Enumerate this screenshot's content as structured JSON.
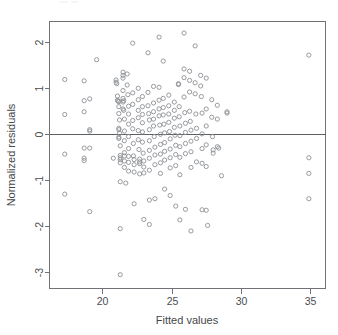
{
  "chart_data": {
    "type": "scatter",
    "title": "",
    "xlabel": "Fitted values",
    "ylabel": "Normalized residuals",
    "xlim": [
      16.2,
      36.1
    ],
    "ylim": [
      -3.35,
      2.45
    ],
    "grid": false,
    "legend": null,
    "marker": "open-circle",
    "marker_color": "#8d9094",
    "xticks": [
      20,
      25,
      30,
      35
    ],
    "xtick_labels": [
      "20",
      "25",
      "30",
      "35"
    ],
    "yticks": [
      2,
      1,
      0,
      -1,
      -2,
      -3
    ],
    "ytick_labels": [
      "2",
      "1",
      "0",
      "-1",
      "-2",
      "-3"
    ],
    "reference_lines": [
      {
        "orientation": "horizontal",
        "value": 0,
        "color": "#5d6063"
      }
    ],
    "n_points": 201,
    "points": [
      [
        17.3,
        1.19
      ],
      [
        17.3,
        0.43
      ],
      [
        17.3,
        -0.43
      ],
      [
        17.3,
        -1.3
      ],
      [
        18.7,
        1.16
      ],
      [
        18.7,
        0.73
      ],
      [
        18.7,
        0.49
      ],
      [
        18.7,
        -0.3
      ],
      [
        18.7,
        -0.52
      ],
      [
        18.7,
        -0.57
      ],
      [
        19.1,
        0.77
      ],
      [
        19.1,
        0.1
      ],
      [
        19.1,
        0.07
      ],
      [
        19.1,
        -0.3
      ],
      [
        19.1,
        -1.68
      ],
      [
        19.6,
        1.62
      ],
      [
        20.8,
        -0.52
      ],
      [
        21.0,
        1.18
      ],
      [
        21.0,
        1.13
      ],
      [
        21.05,
        1.1
      ],
      [
        21.1,
        0.83
      ],
      [
        21.1,
        0.74
      ],
      [
        21.15,
        0.72
      ],
      [
        21.2,
        0.71
      ],
      [
        21.2,
        0.6
      ],
      [
        21.2,
        0.45
      ],
      [
        21.25,
        0.31
      ],
      [
        21.2,
        0.13
      ],
      [
        21.2,
        0.1
      ],
      [
        21.25,
        0.02
      ],
      [
        21.2,
        -0.06
      ],
      [
        21.2,
        -0.09
      ],
      [
        21.3,
        -0.25
      ],
      [
        21.3,
        -0.46
      ],
      [
        21.3,
        -0.51
      ],
      [
        21.3,
        -0.55
      ],
      [
        21.3,
        -0.62
      ],
      [
        21.3,
        -1.03
      ],
      [
        21.3,
        -2.05
      ],
      [
        21.3,
        -3.05
      ],
      [
        21.5,
        1.35
      ],
      [
        21.5,
        1.28
      ],
      [
        21.5,
        1.22
      ],
      [
        21.5,
        0.95
      ],
      [
        21.5,
        0.78
      ],
      [
        21.55,
        0.73
      ],
      [
        21.5,
        0.7
      ],
      [
        21.5,
        0.55
      ],
      [
        21.55,
        0.52
      ],
      [
        21.6,
        0.33
      ],
      [
        21.6,
        0.07
      ],
      [
        21.6,
        -0.14
      ],
      [
        21.6,
        -0.4
      ],
      [
        21.6,
        -0.47
      ],
      [
        21.6,
        -0.58
      ],
      [
        21.6,
        -0.72
      ],
      [
        21.7,
        -1.06
      ],
      [
        21.8,
        1.31
      ],
      [
        21.8,
        1.07
      ],
      [
        21.85,
        0.86
      ],
      [
        21.9,
        0.61
      ],
      [
        21.9,
        0.44
      ],
      [
        21.9,
        0.22
      ],
      [
        21.9,
        -0.05
      ],
      [
        21.9,
        -0.31
      ],
      [
        21.9,
        -0.48
      ],
      [
        21.9,
        -0.61
      ],
      [
        21.9,
        -0.8
      ],
      [
        22.2,
        1.98
      ],
      [
        22.2,
        0.9
      ],
      [
        22.2,
        0.65
      ],
      [
        22.2,
        0.3
      ],
      [
        22.2,
        0.12
      ],
      [
        22.25,
        -0.2
      ],
      [
        22.25,
        -0.47
      ],
      [
        22.3,
        -0.55
      ],
      [
        22.3,
        -0.66
      ],
      [
        22.3,
        -0.82
      ],
      [
        22.3,
        -1.51
      ],
      [
        22.6,
        1.0
      ],
      [
        22.6,
        0.75
      ],
      [
        22.6,
        0.52
      ],
      [
        22.6,
        0.36
      ],
      [
        22.6,
        0.08
      ],
      [
        22.6,
        -0.12
      ],
      [
        22.65,
        -0.33
      ],
      [
        22.7,
        -0.54
      ],
      [
        22.7,
        -0.6
      ],
      [
        22.7,
        -0.64
      ],
      [
        22.7,
        -0.86
      ],
      [
        22.9,
        0.82
      ],
      [
        22.9,
        0.6
      ],
      [
        22.9,
        0.43
      ],
      [
        22.9,
        0.25
      ],
      [
        22.9,
        0.05
      ],
      [
        22.9,
        -0.17
      ],
      [
        22.95,
        -0.41
      ],
      [
        23.0,
        -0.58
      ],
      [
        23.0,
        -0.71
      ],
      [
        23.0,
        -0.84
      ],
      [
        23.0,
        -1.85
      ],
      [
        23.3,
        1.77
      ],
      [
        23.3,
        0.91
      ],
      [
        23.3,
        0.62
      ],
      [
        23.35,
        0.45
      ],
      [
        23.4,
        0.31
      ],
      [
        23.4,
        0.1
      ],
      [
        23.4,
        -0.14
      ],
      [
        23.4,
        -0.35
      ],
      [
        23.4,
        -0.52
      ],
      [
        23.4,
        -0.78
      ],
      [
        23.4,
        -1.43
      ],
      [
        23.4,
        -1.96
      ],
      [
        23.7,
        1.04
      ],
      [
        23.7,
        0.68
      ],
      [
        23.7,
        0.49
      ],
      [
        23.7,
        0.33
      ],
      [
        23.7,
        0.18
      ],
      [
        23.75,
        -0.05
      ],
      [
        23.8,
        -0.28
      ],
      [
        23.8,
        -0.45
      ],
      [
        23.8,
        -0.66
      ],
      [
        23.8,
        -1.4
      ],
      [
        24.1,
        2.11
      ],
      [
        24.1,
        1.02
      ],
      [
        24.1,
        0.74
      ],
      [
        24.1,
        0.55
      ],
      [
        24.1,
        0.4
      ],
      [
        24.15,
        0.2
      ],
      [
        24.2,
        0.0
      ],
      [
        24.2,
        -0.22
      ],
      [
        24.2,
        -0.43
      ],
      [
        24.2,
        -0.62
      ],
      [
        24.2,
        -0.85
      ],
      [
        24.4,
        1.59
      ],
      [
        24.4,
        0.78
      ],
      [
        24.4,
        0.58
      ],
      [
        24.4,
        0.42
      ],
      [
        24.45,
        0.22
      ],
      [
        24.5,
        0.03
      ],
      [
        24.5,
        -0.18
      ],
      [
        24.5,
        -0.37
      ],
      [
        24.5,
        -0.56
      ],
      [
        24.5,
        -1.19
      ],
      [
        24.8,
        0.85
      ],
      [
        24.8,
        0.62
      ],
      [
        24.8,
        0.44
      ],
      [
        24.8,
        0.26
      ],
      [
        24.85,
        0.06
      ],
      [
        24.9,
        -0.1
      ],
      [
        24.9,
        -0.32
      ],
      [
        24.9,
        -0.51
      ],
      [
        24.9,
        -0.73
      ],
      [
        24.9,
        -1.33
      ],
      [
        25.2,
        0.7
      ],
      [
        25.2,
        0.52
      ],
      [
        25.2,
        0.35
      ],
      [
        25.2,
        0.15
      ],
      [
        25.25,
        -0.02
      ],
      [
        25.3,
        -0.24
      ],
      [
        25.3,
        -0.44
      ],
      [
        25.3,
        -0.68
      ],
      [
        25.3,
        -1.56
      ],
      [
        25.5,
        1.1
      ],
      [
        25.5,
        1.08
      ],
      [
        25.55,
        0.6
      ],
      [
        25.55,
        0.38
      ],
      [
        25.6,
        0.18
      ],
      [
        25.6,
        -0.03
      ],
      [
        25.6,
        -0.27
      ],
      [
        25.6,
        -0.5
      ],
      [
        25.6,
        -0.88
      ],
      [
        25.6,
        -1.86
      ],
      [
        25.9,
        2.2
      ],
      [
        25.9,
        1.42
      ],
      [
        25.9,
        1.23
      ],
      [
        25.9,
        0.81
      ],
      [
        25.95,
        0.47
      ],
      [
        26.0,
        0.24
      ],
      [
        26.0,
        0.04
      ],
      [
        26.0,
        -0.2
      ],
      [
        26.0,
        -0.42
      ],
      [
        26.0,
        -1.63
      ],
      [
        26.3,
        1.37
      ],
      [
        26.3,
        1.17
      ],
      [
        26.3,
        0.92
      ],
      [
        26.3,
        0.5
      ],
      [
        26.35,
        0.28
      ],
      [
        26.4,
        0.09
      ],
      [
        26.4,
        -0.15
      ],
      [
        26.4,
        -0.38
      ],
      [
        26.4,
        -0.72
      ],
      [
        26.4,
        -2.1
      ],
      [
        26.7,
        1.92
      ],
      [
        26.7,
        1.12
      ],
      [
        26.7,
        0.88
      ],
      [
        26.75,
        0.44
      ],
      [
        26.8,
        0.13
      ],
      [
        26.8,
        -0.09
      ],
      [
        26.8,
        -0.6
      ],
      [
        27.1,
        1.28
      ],
      [
        27.1,
        1.05
      ],
      [
        27.15,
        0.82
      ],
      [
        27.2,
        0.46
      ],
      [
        27.2,
        0.01
      ],
      [
        27.2,
        -0.31
      ],
      [
        27.2,
        -0.63
      ],
      [
        27.2,
        -1.64
      ],
      [
        27.5,
        1.22
      ],
      [
        27.5,
        0.55
      ],
      [
        27.5,
        0.18
      ],
      [
        27.5,
        -0.23
      ],
      [
        27.5,
        -0.7
      ],
      [
        27.5,
        -1.65
      ],
      [
        27.6,
        -1.98
      ],
      [
        27.9,
        0.75
      ],
      [
        27.9,
        0.37
      ],
      [
        27.95,
        -0.05
      ],
      [
        28.0,
        -0.34
      ],
      [
        28.0,
        -0.41
      ],
      [
        28.3,
        0.63
      ],
      [
        28.3,
        0.33
      ],
      [
        28.3,
        -0.27
      ],
      [
        28.4,
        -0.3
      ],
      [
        28.6,
        -0.9
      ],
      [
        29.0,
        0.49
      ],
      [
        29.0,
        0.46
      ],
      [
        34.9,
        1.72
      ],
      [
        34.9,
        -0.51
      ],
      [
        34.9,
        -0.85
      ],
      [
        34.9,
        -1.4
      ]
    ]
  }
}
